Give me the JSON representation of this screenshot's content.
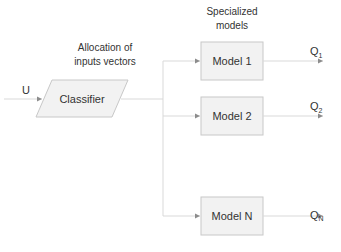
{
  "diagram": {
    "input": {
      "label": "U"
    },
    "classifier": {
      "label": "Classifier",
      "shape": "parallelogram"
    },
    "annotations": {
      "allocation_line1": "Allocation of",
      "allocation_line2": "inputs vectors",
      "specialized_line1": "Specialized",
      "specialized_line2": "models"
    },
    "models": [
      {
        "label": "Model 1",
        "output": "Q",
        "output_sub": "1"
      },
      {
        "label": "Model 2",
        "output": "Q",
        "output_sub": "2"
      },
      {
        "label": "Model N",
        "output": "Q",
        "output_sub": "N"
      }
    ],
    "colors": {
      "node_fill": "#f2f2f2",
      "node_stroke": "#c8c8c8",
      "edge": "#d9d9d9",
      "arrowhead": "#8c8c8c",
      "text": "#333333"
    }
  }
}
